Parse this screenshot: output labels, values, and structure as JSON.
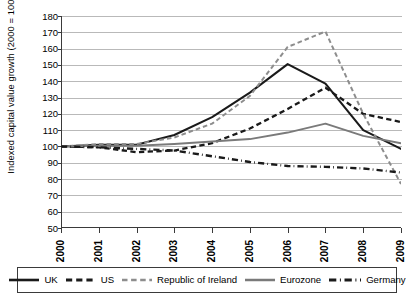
{
  "chart_data": {
    "type": "line",
    "title": "",
    "xlabel": "",
    "ylabel": "Indexed capital value growth (2000 = 100)",
    "x": [
      2000,
      2001,
      2002,
      2003,
      2004,
      2005,
      2006,
      2007,
      2008,
      2009
    ],
    "xticklabels": [
      "2000",
      "2001",
      "2002",
      "2003",
      "2004",
      "2005",
      "2006",
      "2007",
      "2008",
      "2009"
    ],
    "yticks": [
      50,
      60,
      70,
      80,
      90,
      100,
      110,
      120,
      130,
      140,
      150,
      160,
      170,
      180
    ],
    "ylim": [
      50,
      180
    ],
    "xlim": [
      2000,
      2009
    ],
    "grid": "horizontal",
    "legend_position": "bottom",
    "series": [
      {
        "name": "UK",
        "color": "#1a1a1a",
        "style": "solid",
        "width": 2.1,
        "values": [
          100,
          101,
          101,
          107,
          118,
          133,
          150.5,
          138.5,
          110,
          98.5
        ]
      },
      {
        "name": "US",
        "color": "#1a1a1a",
        "style": "dashed",
        "width": 2.3,
        "values": [
          100,
          99.5,
          96.5,
          97.5,
          102,
          111,
          123,
          136,
          120,
          115
        ]
      },
      {
        "name": "Republic of Ireland",
        "color": "#8d8d8d",
        "style": "dashed",
        "width": 2.0,
        "values": [
          100,
          101.5,
          101.5,
          105.5,
          114,
          131,
          161,
          170.5,
          120,
          77
        ]
      },
      {
        "name": "Eurozone",
        "color": "#7a7a7a",
        "style": "solid",
        "width": 2.0,
        "values": [
          100,
          100.5,
          100.5,
          101.5,
          103,
          104.5,
          108.5,
          114,
          106.5,
          102
        ]
      },
      {
        "name": "Germany",
        "color": "#1a1a1a",
        "style": "dashdot",
        "width": 2.4,
        "values": [
          100,
          99.5,
          98.5,
          97.5,
          94,
          90.5,
          88,
          87.5,
          86.5,
          84
        ]
      }
    ]
  },
  "legend": {
    "items": [
      {
        "label": "UK",
        "swatch": "solid-black-line"
      },
      {
        "label": "US",
        "swatch": "dashed-black-line"
      },
      {
        "label": "Republic of Ireland",
        "swatch": "dashed-gray-line"
      },
      {
        "label": "Eurozone",
        "swatch": "solid-gray-line"
      },
      {
        "label": "Germany",
        "swatch": "dashdot-black-line"
      }
    ]
  }
}
